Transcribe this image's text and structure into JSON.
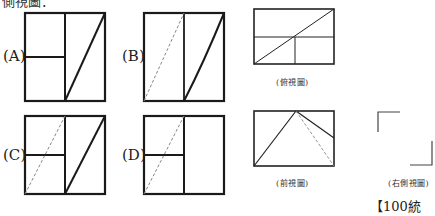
{
  "header": {
    "text": "側視圖："
  },
  "options": [
    {
      "id": "A",
      "label": "(A)"
    },
    {
      "id": "B",
      "label": "(B)"
    },
    {
      "id": "C",
      "label": "(C)"
    },
    {
      "id": "D",
      "label": "(D)"
    }
  ],
  "views": {
    "top": {
      "caption": "(俯視圖)"
    },
    "front": {
      "caption": "(前視圖)"
    },
    "right": {
      "caption": "(右側視圖)"
    }
  },
  "source": "【100統測】",
  "colors": {
    "stroke": "#1a1a1a",
    "dashed": "#777777",
    "thin": "#333333"
  }
}
